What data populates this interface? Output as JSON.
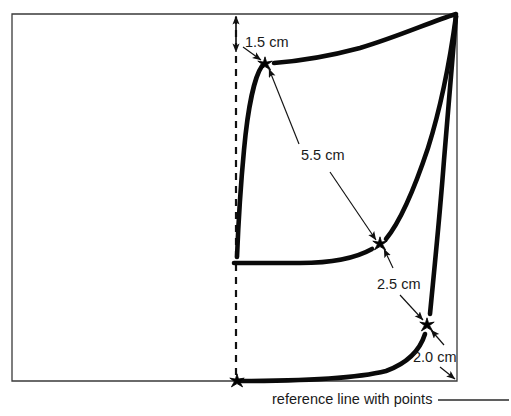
{
  "figure": {
    "type": "technical-measurement-diagram",
    "background_color": "#ffffff",
    "ink_color": "#0a0a0a",
    "frame_color": "#3a3a3a",
    "caption": "reference line with points",
    "annotations": [
      {
        "id": "dim-1-5",
        "label": "1.5 cm",
        "kind": "vertical-offset-dimension",
        "from": "top-border",
        "to": "upper-star-point"
      },
      {
        "id": "dim-5-5",
        "label": "5.5 cm",
        "kind": "double-headed-dimension",
        "from": "upper-star-point",
        "to": "middle-star-point"
      },
      {
        "id": "dim-2-5",
        "label": "2.5 cm",
        "kind": "double-headed-dimension",
        "from": "middle-star-point",
        "to": "lower-star-point"
      },
      {
        "id": "dim-2-0",
        "label": "2.0 cm",
        "kind": "double-headed-dimension",
        "from": "lower-star-point",
        "to": "bottom-right-corner"
      }
    ],
    "reference_points": [
      {
        "id": "baseline-star",
        "x": 237,
        "y": 381
      },
      {
        "id": "upper-star-point",
        "x": 265,
        "y": 64
      },
      {
        "id": "middle-star-point",
        "x": 380,
        "y": 244
      },
      {
        "id": "lower-star-point",
        "x": 427,
        "y": 325
      }
    ],
    "geometry": {
      "frame": {
        "left": 12,
        "top": 14,
        "right": 457,
        "bottom": 381
      },
      "dashed_reference_x": 236,
      "dashed_reference_top": 16,
      "dashed_reference_bottom": 381
    }
  }
}
